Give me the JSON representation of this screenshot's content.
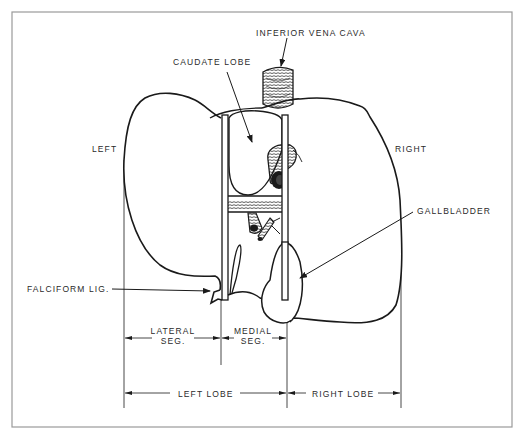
{
  "figure": {
    "labels": {
      "inferior_vena_cava": "INFERIOR VENA CAVA",
      "caudate_lobe": "CAUDATE LOBE",
      "left": "LEFT",
      "right": "RIGHT",
      "gallbladder": "GALLBLADDER",
      "falciform_lig": "FALCIFORM LIG.",
      "lateral_seg_line1": "LATERAL",
      "lateral_seg_line2": "SEG.",
      "medial_seg_line1": "MEDIAL",
      "medial_seg_line2": "SEG.",
      "left_lobe": "LEFT LOBE",
      "right_lobe": "RIGHT LOBE"
    },
    "colors": {
      "ink": "#1a1a1a",
      "frame": "#9a9a9a",
      "background": "#ffffff"
    }
  }
}
